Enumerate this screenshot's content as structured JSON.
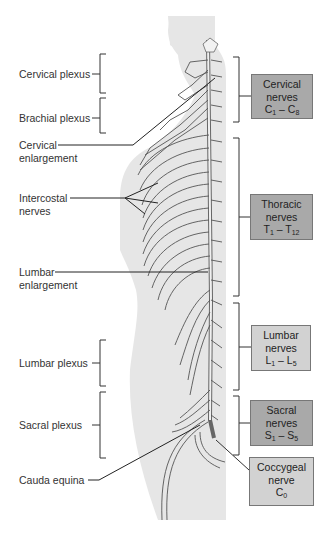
{
  "colors": {
    "body_silhouette": "#e6e6e6",
    "nerve_stroke": "#555555",
    "box_dark": "#a9a9a9",
    "box_light": "#d2d2d2",
    "leader_line": "#222222"
  },
  "left_labels": [
    {
      "id": "cervical-plexus",
      "lines": [
        "Cervical plexus"
      ]
    },
    {
      "id": "brachial-plexus",
      "lines": [
        "Brachial plexus"
      ]
    },
    {
      "id": "cervical-enlargement",
      "lines": [
        "Cervical",
        "enlargement"
      ]
    },
    {
      "id": "intercostal-nerves",
      "lines": [
        "Intercostal",
        "nerves"
      ]
    },
    {
      "id": "lumbar-enlargement",
      "lines": [
        "Lumbar",
        "enlargement"
      ]
    },
    {
      "id": "lumbar-plexus",
      "lines": [
        "Lumbar plexus"
      ]
    },
    {
      "id": "sacral-plexus",
      "lines": [
        "Sacral plexus"
      ]
    },
    {
      "id": "cauda-equina",
      "lines": [
        "Cauda equina"
      ]
    }
  ],
  "right_boxes": [
    {
      "id": "cervical-nerves",
      "name": "Cervical",
      "type": "nerves",
      "range_start": "C",
      "start_sub": "1",
      "dash": " – ",
      "range_end": "C",
      "end_sub": "8",
      "shade": "dark"
    },
    {
      "id": "thoracic-nerves",
      "name": "Thoracic",
      "type": "nerves",
      "range_start": "T",
      "start_sub": "1",
      "dash": " – ",
      "range_end": "T",
      "end_sub": "12",
      "shade": "dark"
    },
    {
      "id": "lumbar-nerves",
      "name": "Lumbar",
      "type": "nerves",
      "range_start": "L",
      "start_sub": "1",
      "dash": " – ",
      "range_end": "L",
      "end_sub": "5",
      "shade": "light"
    },
    {
      "id": "sacral-nerves",
      "name": "Sacral",
      "type": "nerves",
      "range_start": "S",
      "start_sub": "1",
      "dash": " – ",
      "range_end": "S",
      "end_sub": "5",
      "shade": "dark"
    },
    {
      "id": "coccygeal-nerve",
      "name": "Coccygeal",
      "type": "nerve",
      "range_start": "C",
      "start_sub": "0",
      "shade": "light"
    }
  ]
}
